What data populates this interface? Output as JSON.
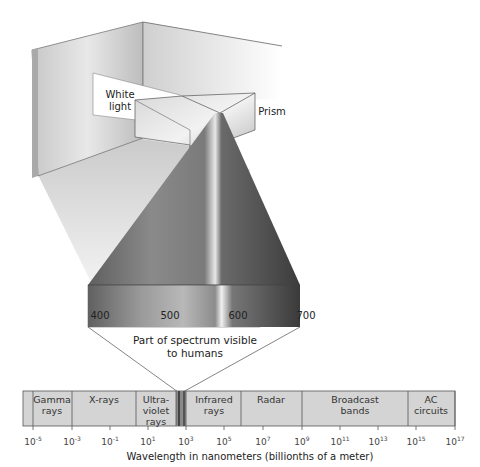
{
  "diagram": {
    "labels": {
      "white_light": "White\nlight",
      "prism": "Prism",
      "visible_caption": "Part of spectrum visible\nto humans",
      "axis_title": "Wavelength in nanometers (billionths of a meter)"
    },
    "visible_ticks": [
      "400",
      "500",
      "600",
      "700"
    ],
    "bands": [
      {
        "label": "Gamma rays"
      },
      {
        "label": "X-rays"
      },
      {
        "label": "Ultra-violet rays"
      },
      {
        "label": "Infrared rays"
      },
      {
        "label": "Radar"
      },
      {
        "label": "Broadcast bands"
      },
      {
        "label": "AC circuits"
      }
    ],
    "axis_ticks": [
      {
        "base": "10",
        "exp": "-5"
      },
      {
        "base": "10",
        "exp": "-3"
      },
      {
        "base": "10",
        "exp": "-1"
      },
      {
        "base": "10",
        "exp": "1"
      },
      {
        "base": "10",
        "exp": "3"
      },
      {
        "base": "10",
        "exp": "5"
      },
      {
        "base": "10",
        "exp": "7"
      },
      {
        "base": "10",
        "exp": "9"
      },
      {
        "base": "10",
        "exp": "11"
      },
      {
        "base": "10",
        "exp": "13"
      },
      {
        "base": "10",
        "exp": "15"
      },
      {
        "base": "10",
        "exp": "17"
      }
    ],
    "colors": {
      "band_fill": "#d4d4d4",
      "wall_light": "#e6e6e6",
      "wall_dark": "#b5b5b5",
      "beam_dark": "#5a5a5a",
      "beam_mid": "#8a8a8a"
    }
  }
}
